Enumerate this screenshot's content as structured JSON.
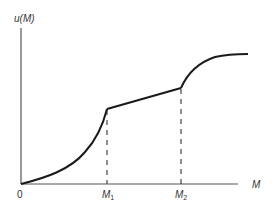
{
  "diagram": {
    "y_axis_label": "u(M)",
    "x_axis_label": "M",
    "origin_label": "0",
    "markers": [
      {
        "base": "M",
        "sub": "1"
      },
      {
        "base": "M",
        "sub": "2"
      }
    ]
  },
  "colors": {
    "curve": "#1a1a1a",
    "axis": "#555555",
    "dash": "#333333",
    "text": "#333333"
  }
}
